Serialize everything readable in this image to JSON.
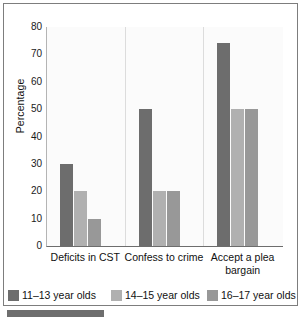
{
  "chart_data": {
    "type": "bar",
    "title": "",
    "xlabel": "",
    "ylabel": "Percentage",
    "ylim": [
      0,
      80
    ],
    "yticks": [
      "0",
      "10",
      "20",
      "30",
      "40",
      "50",
      "60",
      "70",
      "80"
    ],
    "grid": true,
    "legend_position": "bottom",
    "categories": [
      "Deficits in CST",
      "Confess to crime",
      "Accept a plea bargain"
    ],
    "series": [
      {
        "name": "11–13 year olds",
        "color": "#6d6d6d",
        "values": [
          30,
          50,
          74
        ]
      },
      {
        "name": "14–15 year olds",
        "color": "#b0b0b0",
        "values": [
          20,
          20,
          50
        ]
      },
      {
        "name": "16–17 year olds",
        "color": "#989898",
        "values": [
          10,
          20,
          50
        ]
      }
    ]
  },
  "legend": {
    "items": [
      {
        "label": "11–13 year olds",
        "color": "#6d6d6d"
      },
      {
        "label": "14–15 year olds",
        "color": "#b0b0b0"
      },
      {
        "label": "16–17 year olds",
        "color": "#989898"
      }
    ]
  },
  "axis": {
    "y_title": "Percentage"
  },
  "colors": {
    "frame": "#7d7d7d",
    "grid": "#cfcfcf",
    "baseline": "#6d6d6d",
    "accent_bar": "#6e6e6e",
    "plot_bg": "#fbfbfb",
    "text": "#111111"
  }
}
